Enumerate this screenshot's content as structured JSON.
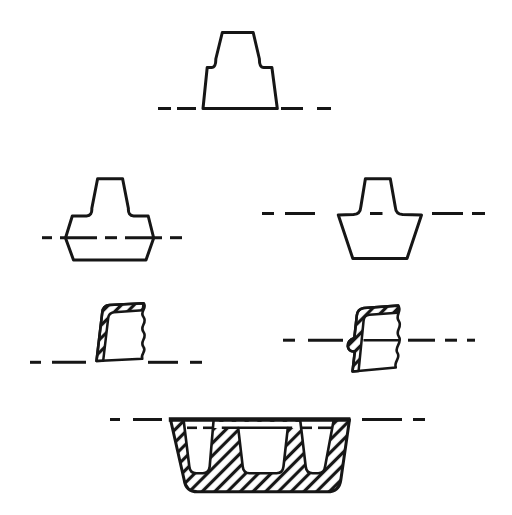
{
  "page": {
    "background": "#ffffff",
    "ink": "#161616",
    "title": "",
    "visible_text": []
  },
  "figures": [
    {
      "id": "profile-top",
      "description": "stepped flat-bottom profile on ground line"
    },
    {
      "id": "profile-mid-left",
      "description": "stepped profile with hexagonal body straddling centerline"
    },
    {
      "id": "profile-mid-right",
      "description": "stepped profile with inverted-trapezoid body below centerline"
    },
    {
      "id": "section-small-left",
      "description": "hatched wall cross-section fragment with wavy break, on baseline"
    },
    {
      "id": "section-small-right",
      "description": "hatched wall cross-section fragment with flange bump on centerline"
    },
    {
      "id": "section-mold",
      "description": "large hatched trough mold cross-section with three tapered cavities"
    }
  ],
  "centerlines": [
    {
      "figure": "profile-top",
      "y": 108.5,
      "segments": [
        [
          158,
          171
        ],
        [
          177,
          196
        ],
        [
          281,
          303
        ],
        [
          317,
          331
        ]
      ]
    },
    {
      "figure": "profile-mid-left",
      "y": 237.7,
      "segments": [
        [
          42,
          52
        ],
        [
          60,
          97
        ],
        [
          105,
          117
        ],
        [
          125,
          162
        ],
        [
          170,
          182
        ]
      ]
    },
    {
      "figure": "profile-mid-right",
      "y": 213.5,
      "segments": [
        [
          262,
          274
        ],
        [
          285,
          315
        ],
        [
          370,
          382.5
        ],
        [
          432,
          463
        ],
        [
          472,
          485
        ]
      ]
    },
    {
      "figure": "section-small-left",
      "y": 362.3,
      "segments": [
        [
          30,
          41
        ],
        [
          52,
          86
        ],
        [
          148,
          178
        ],
        [
          190,
          202
        ]
      ]
    },
    {
      "figure": "section-small-right",
      "y": 340.2,
      "segments": [
        [
          283,
          295
        ],
        [
          308,
          343
        ],
        [
          408,
          435
        ],
        [
          445,
          457
        ],
        [
          467,
          475
        ]
      ]
    },
    {
      "figure": "section-mold",
      "y": 419.5,
      "segments": [
        [
          110,
          120
        ],
        [
          133,
          162
        ],
        [
          362,
          402
        ],
        [
          413,
          425
        ]
      ]
    },
    {
      "figure": "section-mold-inner",
      "y": 427.8,
      "segments": [
        [
          187,
          197
        ],
        [
          203,
          213.5
        ],
        [
          300,
          312
        ],
        [
          318,
          332
        ]
      ]
    }
  ],
  "solid_lines": [
    {
      "figure": "section-small-right",
      "y": 340.2,
      "x1": 363.5,
      "x2": 399.5
    },
    {
      "figure": "section-mold-divider-top",
      "y": 427.8,
      "x1": 221.8,
      "x2": 292.2
    }
  ]
}
